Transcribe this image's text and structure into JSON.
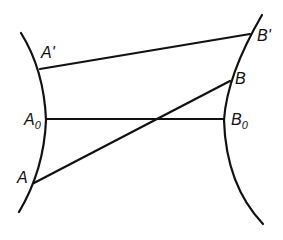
{
  "diagram": {
    "stroke_color": "#111111",
    "background": "#ffffff",
    "curves": [
      {
        "name": "left-boundary-curve",
        "path": "M21,33 Q44,70 46,120 Q44,170 19,212"
      },
      {
        "name": "right-boundary-curve",
        "path": "M262,15 Q227,75 224,120 Q226,185 263,224"
      }
    ],
    "segments": [
      {
        "name": "segment-a-prime-b-prime",
        "from": "A'",
        "to": "B'",
        "x1": 40,
        "y1": 69,
        "x2": 250,
        "y2": 34
      },
      {
        "name": "segment-a0-b0",
        "from": "A0",
        "to": "B0",
        "x1": 47,
        "y1": 119,
        "x2": 224,
        "y2": 119
      },
      {
        "name": "segment-a-b",
        "from": "A",
        "to": "B",
        "x1": 34,
        "y1": 183,
        "x2": 230,
        "y2": 81
      }
    ],
    "labels": {
      "a_prime": {
        "main": "A",
        "suffix": "'"
      },
      "a0": {
        "main": "A",
        "sub": "0"
      },
      "a": {
        "main": "A"
      },
      "b_prime": {
        "main": "B",
        "suffix": "'"
      },
      "b": {
        "main": "B"
      },
      "b0": {
        "main": "B",
        "sub": "0"
      }
    }
  }
}
